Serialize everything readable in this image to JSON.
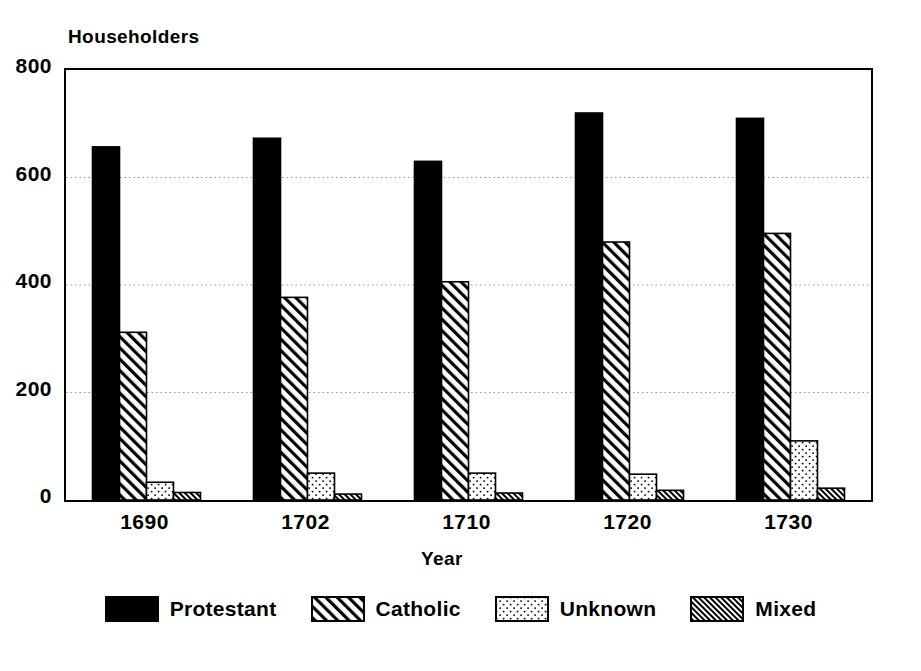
{
  "chart_data": {
    "type": "bar",
    "title": "",
    "ylabel": "Householders",
    "xlabel": "Year",
    "categories": [
      "1690",
      "1702",
      "1710",
      "1720",
      "1730"
    ],
    "series": [
      {
        "name": "Protestant",
        "pattern": "solid-black",
        "values": [
          657,
          673,
          630,
          720,
          710
        ]
      },
      {
        "name": "Catholic",
        "pattern": "diagonal-hatch-sparse",
        "values": [
          312,
          377,
          406,
          480,
          496
        ]
      },
      {
        "name": "Unknown",
        "pattern": "dotted-stipple",
        "values": [
          33,
          50,
          50,
          48,
          110
        ]
      },
      {
        "name": "Mixed",
        "pattern": "diagonal-hatch-dense",
        "values": [
          14,
          11,
          13,
          18,
          22
        ]
      }
    ],
    "ylim": [
      0,
      800
    ],
    "yticks": [
      0,
      200,
      400,
      600,
      800
    ],
    "grid": true,
    "grid_style": "dotted-horizontal",
    "legend_position": "bottom-center",
    "colors": {
      "foreground": "#000000",
      "background": "#ffffff",
      "grid": "#999999"
    }
  },
  "legend": {
    "items": [
      {
        "label": "Protestant"
      },
      {
        "label": "Catholic"
      },
      {
        "label": "Unknown"
      },
      {
        "label": "Mixed"
      }
    ]
  }
}
